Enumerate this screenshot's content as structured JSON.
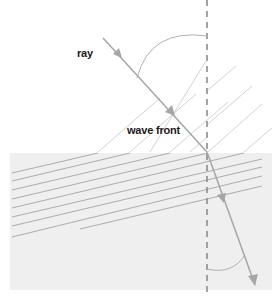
{
  "diagram": {
    "type": "refraction-of-wave-fronts",
    "labels": {
      "ray": "ray",
      "wave_front": "wave front"
    },
    "colors": {
      "background": "#ffffff",
      "lower_medium": "#efefef",
      "ray": "#a6a6a6",
      "wave_front": "#c4c4c4",
      "normal_dashed": "#8c8c8c",
      "angle_arc": "#a8a8a8",
      "text": "#1a1a1a"
    },
    "elements": [
      "incident ray with arrows",
      "refracted ray with arrows",
      "dashed normal line",
      "incident wave fronts (diagonal)",
      "refracted wave fronts (shallow)",
      "angle of incidence arc",
      "angle of refraction arc",
      "denser medium region"
    ]
  }
}
